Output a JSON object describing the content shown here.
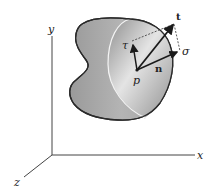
{
  "figure": {
    "axes": {
      "x_label": "x",
      "y_label": "y",
      "z_label": "z"
    },
    "point_label": "p",
    "vectors": {
      "traction_label": "t",
      "normal_label": "n",
      "normal_stress_label": "σ",
      "shear_stress_label": "τ"
    },
    "colors": {
      "body_fill": "#a8a8a8",
      "cut_face_light": "#e6e6e6",
      "cut_face_dark": "#8c8c8c",
      "outline": "#2a2a2a",
      "axis": "#444444"
    }
  }
}
